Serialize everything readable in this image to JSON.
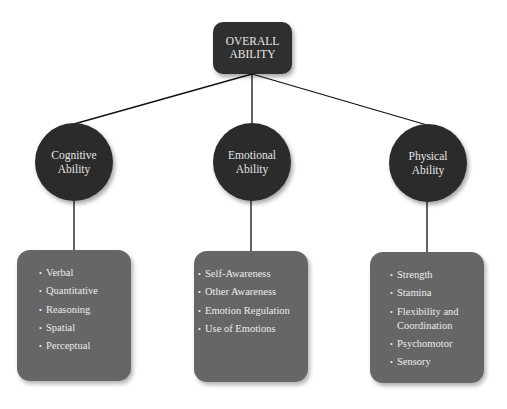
{
  "root": {
    "line1": "OVERALL",
    "line2": "ABILITY"
  },
  "categories": [
    {
      "line1": "Cognitive",
      "line2": "Ability",
      "items": [
        "Verbal",
        "Quantitative",
        "Reasoning",
        "Spatial",
        "Perceptual"
      ]
    },
    {
      "line1": "Emotional",
      "line2": "Ability",
      "items": [
        "Self-Awareness",
        "Other Awareness",
        "Emotion Regulation",
        "Use of Emotions"
      ]
    },
    {
      "line1": "Physical",
      "line2": "Ability",
      "items": [
        "Strength",
        "Stamina",
        "Flexibility and",
        "Coordination",
        "Psychomotor",
        "Sensory"
      ]
    }
  ],
  "bullet": "•",
  "colors": {
    "node_dark": "#2b2b2b",
    "box_gray": "#666666",
    "line": "#111111",
    "text": "#e8e8e8"
  }
}
